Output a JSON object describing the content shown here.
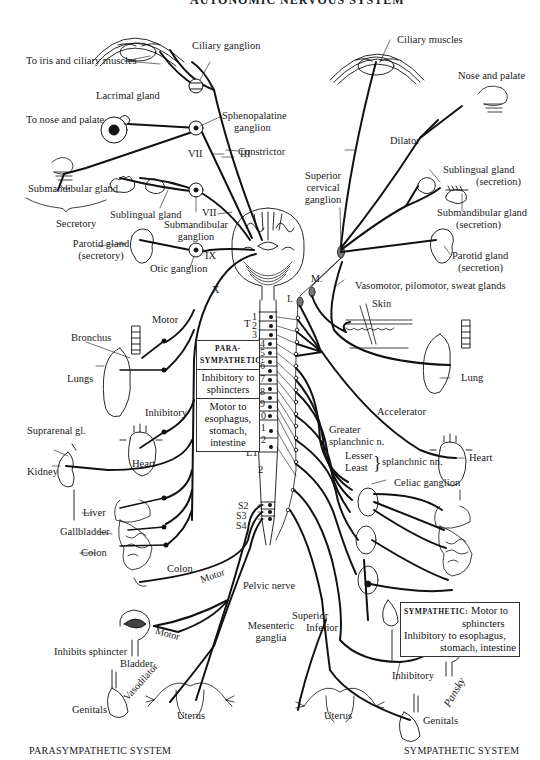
{
  "title_partial": "AUTONOMIC NERVOUS SYSTEM",
  "footer": {
    "left": "PARASYMPATHETIC SYSTEM",
    "right": "SYMPATHETIC SYSTEM"
  },
  "signature": "Pansky",
  "parasympathetic_labels": {
    "iris": "To iris and ciliary muscles",
    "ciliary_ganglion": "Ciliary ganglion",
    "lacrimal": "Lacrimal gland",
    "spheno_1": "Sphenopalatine",
    "spheno_2": "ganglion",
    "nose": "To nose and palate",
    "constrictor": "Constrictor",
    "vii_a": "VII",
    "iii": "III",
    "vii_b": "VII",
    "submandibular_gland": "Submandibular gland",
    "secretory": "Secretory",
    "sublingual_gland": "Sublingual gland",
    "submandibular_ganglion_1": "Submandibular",
    "submandibular_ganglion_2": "ganglion",
    "parotid_1": "Parotid gland",
    "parotid_2": "(secretory)",
    "otic": "Otic ganglion",
    "ix": "IX",
    "x": "X",
    "motor_bronchus": "Motor",
    "bronchus": "Bronchus",
    "lungs": "Lungs",
    "inhibitory_heart": "Inhibitory",
    "suprarenal": "Suprarenal gl.",
    "kidney": "Kidney",
    "heart": "Heart",
    "liver": "Liver",
    "gallbladder": "Gallbladder",
    "colon_a": "Colon",
    "colon_b": "Colon",
    "motor_colon": "Motor",
    "pelvic_nerve": "Pelvic nerve",
    "motor_bladder": "Motor",
    "inhibits_sphincter": "Inhibits sphincter",
    "bladder": "Bladder",
    "vasodilator": "Vasodilator",
    "genitals": "Genitals",
    "uterus": "Uterus"
  },
  "spinal_labels": {
    "t": "T",
    "thoracic": [
      "1",
      "2",
      "3",
      "4",
      "5",
      "6",
      "7",
      "8",
      "9",
      "10",
      "11",
      "12"
    ],
    "lumbar": [
      "L1",
      "2"
    ],
    "sacral": [
      "S2",
      "S3",
      "S4"
    ],
    "l_marker": "I.",
    "m_marker": "M."
  },
  "parasympathetic_box": {
    "head_1": "PARA-",
    "head_2": "SYMPATHETIC:",
    "item_1a": "Inhibitory to",
    "item_1b": "sphincters",
    "item_2a": "Motor to",
    "item_2b": "esophagus,",
    "item_2c": "stomach,",
    "item_2d": "intestine"
  },
  "sympathetic_labels": {
    "ciliary_muscles": "Ciliary muscles",
    "nose_palate": "Nose and palate",
    "dilator": "Dilator",
    "sup_cervical_1": "Superior",
    "sup_cervical_2": "cervical",
    "sup_cervical_3": "ganglion",
    "sublingual_1": "Sublingual gland",
    "sublingual_2": "(secretion)",
    "submandibular_1": "Submandibular gland",
    "submandibular_2": "(secretion)",
    "parotid_1": "Parotid gland",
    "parotid_2": "(secretion)",
    "vasomotor": "Vasomotor, pilomotor, sweat glands",
    "skin": "Skin",
    "lung": "Lung",
    "accelerator": "Accelerator",
    "heart": "Heart",
    "greater_1": "Greater",
    "greater_2": "splanchnic n.",
    "lesser": "Lesser",
    "least": "Least",
    "splanchnic_nn": "splanchnic nn.",
    "celiac": "Celiac ganglion",
    "superior": "Superior",
    "inferior": "Inferior",
    "mesenteric_1": "Mesenteric",
    "mesenteric_2": "ganglia",
    "bladder": "Bladder",
    "inhibitory": "Inhibitory",
    "uterus": "Uterus",
    "genitals": "Genitals"
  },
  "sympathetic_box": {
    "head": "SYMPATHETIC:",
    "line_1": "Motor to",
    "line_2": "sphincters",
    "line_3": "Inhibitory to esophagus,",
    "line_4": "stomach, intestine"
  }
}
